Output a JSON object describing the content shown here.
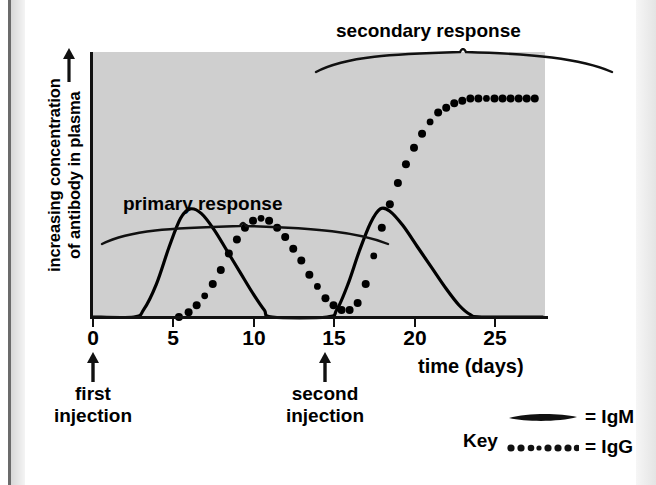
{
  "figure": {
    "background_color": "#ffffff",
    "plot_background_color": "#cfcfcf",
    "axis_color": "#111111"
  },
  "axes": {
    "y_label_line1": "increasing concentration",
    "y_label_line2": "of antibody in plasma",
    "y_label_full": "increasing concentration of antibody in plasma",
    "y_arrow_icon": "up-arrow-icon",
    "x_label": "time (days)",
    "x_ticks": [
      "0",
      "5",
      "10",
      "15",
      "20",
      "25"
    ]
  },
  "annotations": {
    "primary_response": "primary response",
    "secondary_response": "secondary response",
    "first_injection_line1": "first",
    "first_injection_line2": "injection",
    "second_injection_line1": "second",
    "second_injection_line2": "injection",
    "first_injection_day": 0,
    "second_injection_day": 14
  },
  "legend": {
    "title": "Key",
    "items": [
      {
        "label": "= IgM",
        "style": "solid",
        "series": "IgM"
      },
      {
        "label": "= IgG",
        "style": "dotted",
        "series": "IgG"
      }
    ]
  },
  "chart_data": {
    "type": "line",
    "title": "",
    "xlabel": "time (days)",
    "ylabel": "increasing concentration of antibody in plasma",
    "xlim": [
      0,
      28
    ],
    "ylim": [
      0,
      100
    ],
    "grid": false,
    "y_axis_quantitative": false,
    "legend_position": "bottom-right",
    "series": [
      {
        "name": "IgM",
        "style": "solid",
        "color": "#000000",
        "points": [
          [
            0,
            0
          ],
          [
            2.6,
            0
          ],
          [
            3.2,
            3
          ],
          [
            4.0,
            14
          ],
          [
            4.8,
            30
          ],
          [
            5.5,
            42
          ],
          [
            6.1,
            46
          ],
          [
            6.8,
            44
          ],
          [
            7.6,
            37
          ],
          [
            8.4,
            28
          ],
          [
            9.2,
            19
          ],
          [
            10.0,
            10
          ],
          [
            10.7,
            3
          ],
          [
            11.2,
            0
          ],
          [
            14.6,
            0
          ],
          [
            15.2,
            3
          ],
          [
            15.9,
            14
          ],
          [
            16.6,
            28
          ],
          [
            17.3,
            40
          ],
          [
            17.9,
            46
          ],
          [
            18.5,
            45
          ],
          [
            19.3,
            39
          ],
          [
            20.2,
            30
          ],
          [
            21.1,
            21
          ],
          [
            22.0,
            12
          ],
          [
            22.8,
            5
          ],
          [
            23.5,
            1
          ],
          [
            24.2,
            0
          ],
          [
            28,
            0
          ]
        ]
      },
      {
        "name": "IgG",
        "style": "dotted",
        "color": "#000000",
        "points": [
          [
            5.4,
            0
          ],
          [
            6.0,
            2
          ],
          [
            6.5,
            5
          ],
          [
            7.0,
            9
          ],
          [
            7.5,
            14
          ],
          [
            8.0,
            20
          ],
          [
            8.5,
            27
          ],
          [
            9.0,
            33
          ],
          [
            9.5,
            38
          ],
          [
            10.0,
            41
          ],
          [
            10.5,
            42
          ],
          [
            11.0,
            41
          ],
          [
            11.5,
            38
          ],
          [
            12.0,
            34
          ],
          [
            12.5,
            29
          ],
          [
            13.0,
            24
          ],
          [
            13.5,
            18
          ],
          [
            14.0,
            13
          ],
          [
            14.5,
            8
          ],
          [
            15.0,
            5
          ],
          [
            15.5,
            3
          ],
          [
            16.0,
            3
          ],
          [
            16.5,
            6
          ],
          [
            17.0,
            14
          ],
          [
            17.5,
            26
          ],
          [
            18.0,
            38
          ],
          [
            18.5,
            48
          ],
          [
            19.0,
            57
          ],
          [
            19.5,
            65
          ],
          [
            20.0,
            72
          ],
          [
            20.5,
            78
          ],
          [
            21.0,
            83
          ],
          [
            21.5,
            87
          ],
          [
            22.0,
            89
          ],
          [
            22.5,
            91
          ],
          [
            23.0,
            92
          ],
          [
            23.5,
            93
          ],
          [
            24.0,
            93
          ],
          [
            24.5,
            93
          ],
          [
            25.0,
            93
          ],
          [
            25.5,
            93
          ],
          [
            26.0,
            93
          ],
          [
            26.5,
            93
          ],
          [
            27.0,
            93
          ],
          [
            27.5,
            93
          ]
        ]
      }
    ]
  }
}
